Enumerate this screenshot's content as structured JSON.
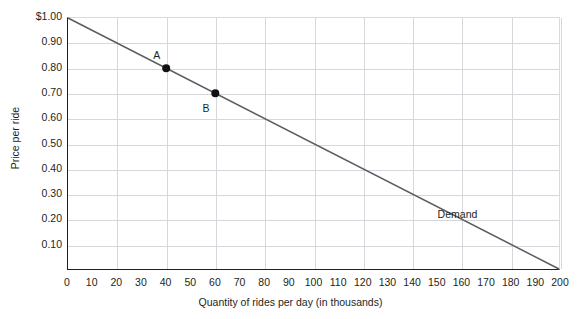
{
  "chart_data": {
    "type": "line",
    "title": "",
    "xlabel": "Quantity of rides per day (in thousands)",
    "ylabel": "Price per ride",
    "xlim": [
      0,
      200
    ],
    "ylim": [
      0,
      1.0
    ],
    "grid": true,
    "legend_position": "none",
    "x_ticks": [
      0,
      10,
      20,
      30,
      40,
      50,
      60,
      70,
      80,
      90,
      100,
      110,
      120,
      130,
      140,
      150,
      160,
      170,
      180,
      190,
      200
    ],
    "x_tick_labels": [
      "0",
      "10",
      "20",
      "30",
      "40",
      "50",
      "60",
      "70",
      "80",
      "90",
      "100",
      "110",
      "120",
      "130",
      "140",
      "150",
      "160",
      "170",
      "180",
      "190",
      "200"
    ],
    "x_gridline_values": [
      20,
      40,
      60,
      80,
      100,
      120,
      140,
      160,
      180,
      200
    ],
    "y_ticks": [
      0.1,
      0.2,
      0.3,
      0.4,
      0.5,
      0.6,
      0.7,
      0.8,
      0.9,
      1.0
    ],
    "y_tick_labels": [
      "0.10",
      "0.20",
      "0.30",
      "0.40",
      "0.50",
      "0.60",
      "0.70",
      "0.80",
      "0.90",
      "$1.00"
    ],
    "y_gridline_values": [
      0.1,
      0.2,
      0.3,
      0.4,
      0.5,
      0.6,
      0.7,
      0.8,
      0.9
    ],
    "series": [
      {
        "name": "Demand",
        "label": "Demand",
        "label_x": 158,
        "label_y": 0.225,
        "color": "#5c5c64",
        "x": [
          0,
          200
        ],
        "values": [
          1.0,
          0.0
        ]
      }
    ],
    "points": [
      {
        "label": "A",
        "x": 40,
        "y": 0.8,
        "label_x": 36,
        "label_y": 0.855,
        "color": "#111111"
      },
      {
        "label": "B",
        "x": 60,
        "y": 0.7,
        "label_x": 56,
        "label_y": 0.645,
        "color": "#111111"
      }
    ],
    "colors": {
      "axis": "#231f20",
      "grid": "#d5d7dc",
      "line": "#5c5c64",
      "point": "#111111",
      "text": "#231f20",
      "background": "#ffffff"
    }
  }
}
